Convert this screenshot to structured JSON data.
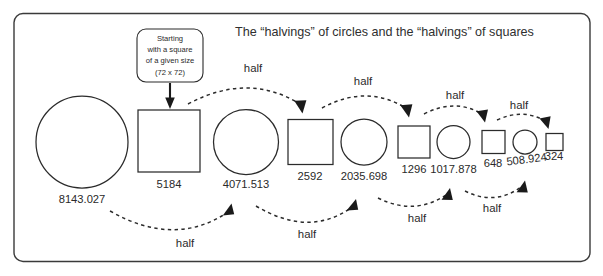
{
  "frame": {
    "border_color": "#3a3a3a",
    "background_color": "#ffffff"
  },
  "title_text": "The “halvings” of circles and the “halvings” of squares",
  "callout": {
    "lines": [
      "Starting",
      "with a square",
      "of a given size",
      "(72 x 72)"
    ],
    "line1": "Starting",
    "line2": "with a square",
    "line3": "of a given size",
    "line4": "(72 x 72)"
  },
  "shapes": [
    {
      "kind": "circle",
      "label": "8143.027",
      "size": 92
    },
    {
      "kind": "square",
      "label": "5184",
      "size": 62
    },
    {
      "kind": "circle",
      "label": "4071.513",
      "size": 65
    },
    {
      "kind": "square",
      "label": "2592",
      "size": 45
    },
    {
      "kind": "circle",
      "label": "2035.698",
      "size": 46
    },
    {
      "kind": "square",
      "label": "1296",
      "size": 32
    },
    {
      "kind": "circle",
      "label": "1017.878",
      "size": 33
    },
    {
      "kind": "square",
      "label": "648",
      "size": 23
    },
    {
      "kind": "circle",
      "label": "508.924",
      "size": 24
    },
    {
      "kind": "square",
      "label": "324",
      "size": 17
    }
  ],
  "labels": {
    "circle_1": "8143.027",
    "square_1": "5184",
    "circle_2": "4071.513",
    "square_2": "2592",
    "circle_3": "2035.698",
    "square_3": "1296",
    "circle_4": "1017.878",
    "square_4": "648",
    "circle_5": "508.924",
    "square_5": "324"
  },
  "arrows": {
    "top": [
      {
        "label": "half",
        "from": "square_1",
        "to": "square_2"
      },
      {
        "label": "half",
        "from": "square_2",
        "to": "square_3"
      },
      {
        "label": "half",
        "from": "square_3",
        "to": "square_4"
      },
      {
        "label": "half",
        "from": "square_4",
        "to": "square_5"
      }
    ],
    "bottom": [
      {
        "label": "half",
        "from": "circle_1",
        "to": "circle_2"
      },
      {
        "label": "half",
        "from": "circle_2",
        "to": "circle_3"
      },
      {
        "label": "half",
        "from": "circle_3",
        "to": "circle_4"
      },
      {
        "label": "half",
        "from": "circle_4",
        "to": "circle_5"
      }
    ],
    "top_1_label": "half",
    "top_2_label": "half",
    "top_3_label": "half",
    "top_4_label": "half",
    "bottom_1_label": "half",
    "bottom_2_label": "half",
    "bottom_3_label": "half",
    "bottom_4_label": "half"
  }
}
